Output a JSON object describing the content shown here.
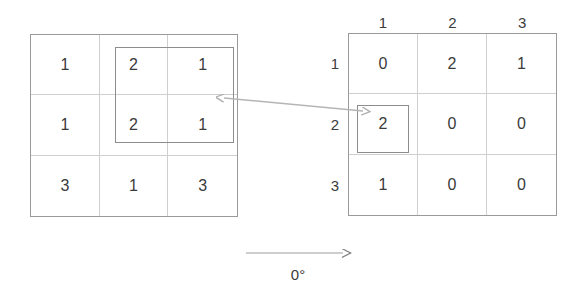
{
  "diagram": {
    "title_label": "0°",
    "stroke_color": "#9a9a9a",
    "gridline_color": "#cfcfcf",
    "highlight_color": "#8d8d8d",
    "text_color": "#3b3b3b",
    "background": "#ffffff"
  },
  "left_grid": {
    "name": "source-matrix",
    "rows": 3,
    "cols": 3,
    "cells": [
      [
        "1",
        "2",
        "1"
      ],
      [
        "1",
        "2",
        "1"
      ],
      [
        "3",
        "1",
        "3"
      ]
    ],
    "highlight": {
      "label": "selected-window",
      "start_row": 1,
      "start_col": 2,
      "row_span": 2,
      "col_span": 2
    }
  },
  "right_grid": {
    "name": "glcm-matrix",
    "rows": 3,
    "cols": 3,
    "col_headers": [
      "1",
      "2",
      "3"
    ],
    "row_headers": [
      "1",
      "2",
      "3"
    ],
    "cells": [
      [
        "0",
        "2",
        "1"
      ],
      [
        "2",
        "0",
        "0"
      ],
      [
        "1",
        "0",
        "0"
      ]
    ],
    "highlight": {
      "label": "result-cell",
      "row": 2,
      "col": 1
    }
  },
  "connector": {
    "name": "mapping-arrow",
    "style": "double-headed"
  },
  "direction": {
    "name": "orientation-arrow",
    "angle_label": "0°"
  }
}
